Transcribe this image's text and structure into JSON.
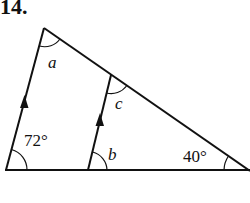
{
  "problem_number": "14.",
  "labels": {
    "a": "a",
    "b": "b",
    "c": "c",
    "angle_left": "72°",
    "angle_right": "40°"
  },
  "colors": {
    "stroke": "#111111"
  }
}
